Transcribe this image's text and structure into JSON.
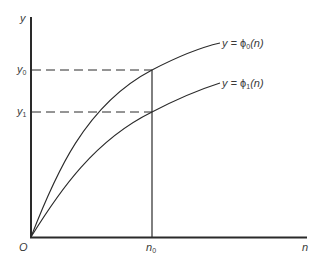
{
  "diagram": {
    "axes": {
      "y_label": "y",
      "x_label": "n",
      "origin_label": "O"
    },
    "ticks": {
      "y0": {
        "base": "y",
        "sub": "0"
      },
      "y1": {
        "base": "y",
        "sub": "1"
      },
      "n0": {
        "base": "n",
        "sub": "0"
      }
    },
    "curves": [
      {
        "label_prefix": "y = ",
        "func": "ϕ",
        "sub": "0",
        "arg": "(n)"
      },
      {
        "label_prefix": "y = ",
        "func": "ϕ",
        "sub": "1",
        "arg": "(n)"
      }
    ],
    "colors": {
      "line": "#2a2a2a",
      "text": "#3a3a3a"
    }
  }
}
